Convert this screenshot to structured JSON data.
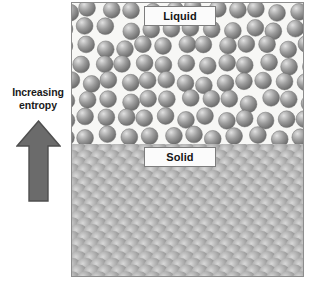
{
  "diagram": {
    "annotation": {
      "line1": "Increasing",
      "line2": "entropy",
      "arrow_name": "up-arrow-icon",
      "arrow_direction": "up",
      "arrow_color": "#6b6b6b",
      "arrow_outline_color": "#4f4f4f"
    },
    "frame": {
      "border_color": "#8d8d8d"
    },
    "phases": [
      {
        "key": "liquid",
        "label": "Liquid",
        "background_color": "#f7f7f5",
        "particle_color": "#8e8e8e",
        "particle_highlight_color": "#d8d8d8",
        "arrangement": "disordered",
        "particle_count": 63,
        "particle_radius_px": 8.4
      },
      {
        "key": "solid",
        "label": "Solid",
        "background_color": "#8a8a8a",
        "particle_color": "#9a9a9a",
        "particle_highlight_color": "#d2d2d2",
        "arrangement": "ordered-lattice",
        "lattice_type": "diagonal close-packed",
        "lattice_period_px": 13.5
      }
    ]
  }
}
